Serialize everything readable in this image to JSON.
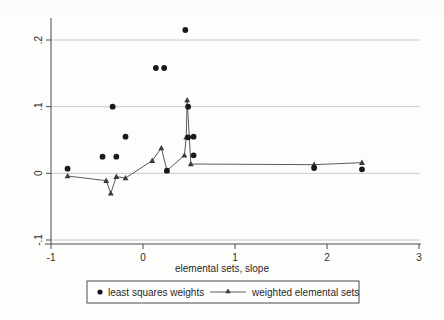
{
  "page": {
    "partial_header_text": ""
  },
  "chart_data": {
    "type": "scatter",
    "title": "",
    "xlabel": "elemental sets, slope",
    "ylabel": "",
    "xlim": [
      -1,
      3
    ],
    "ylim": [
      -0.1,
      0.23
    ],
    "xticks": [
      -1,
      0,
      1,
      2,
      3
    ],
    "xtick_labels": [
      "-1",
      "0",
      "1",
      "2",
      "3"
    ],
    "yticks": [
      -0.1,
      0,
      0.1,
      0.2
    ],
    "ytick_labels": [
      "-.1",
      "0",
      ".1",
      ".2"
    ],
    "grid": "horizontal",
    "legend_position": "below",
    "series": [
      {
        "name": "least squares weights",
        "marker": "circle",
        "type": "scatter",
        "points": [
          {
            "x": -0.82,
            "y": 0.007
          },
          {
            "x": -0.44,
            "y": 0.025
          },
          {
            "x": -0.33,
            "y": 0.1
          },
          {
            "x": -0.29,
            "y": 0.025
          },
          {
            "x": -0.19,
            "y": 0.055
          },
          {
            "x": 0.14,
            "y": 0.158
          },
          {
            "x": 0.23,
            "y": 0.158
          },
          {
            "x": 0.26,
            "y": 0.004
          },
          {
            "x": 0.46,
            "y": 0.215
          },
          {
            "x": 0.49,
            "y": 0.1
          },
          {
            "x": 0.49,
            "y": 0.054
          },
          {
            "x": 0.55,
            "y": 0.055
          },
          {
            "x": 0.55,
            "y": 0.027
          },
          {
            "x": 1.86,
            "y": 0.008
          },
          {
            "x": 2.38,
            "y": 0.006
          }
        ]
      },
      {
        "name": "weighted elemental sets",
        "marker": "triangle",
        "type": "line",
        "points": [
          {
            "x": -0.82,
            "y": -0.004
          },
          {
            "x": -0.4,
            "y": -0.011
          },
          {
            "x": -0.35,
            "y": -0.03
          },
          {
            "x": -0.29,
            "y": -0.005
          },
          {
            "x": -0.19,
            "y": -0.007
          },
          {
            "x": 0.1,
            "y": 0.019
          },
          {
            "x": 0.2,
            "y": 0.038
          },
          {
            "x": 0.26,
            "y": 0.004
          },
          {
            "x": 0.45,
            "y": 0.027
          },
          {
            "x": 0.47,
            "y": 0.054
          },
          {
            "x": 0.48,
            "y": 0.11
          },
          {
            "x": 0.52,
            "y": 0.014
          },
          {
            "x": 1.86,
            "y": 0.013
          },
          {
            "x": 2.38,
            "y": 0.016
          }
        ]
      }
    ]
  }
}
